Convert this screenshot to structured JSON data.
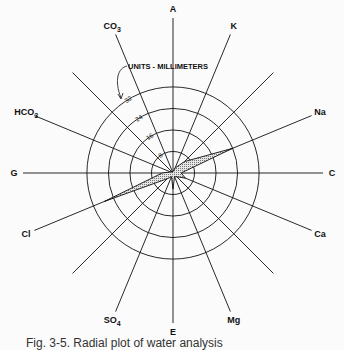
{
  "diagram": {
    "type": "radial-ion-diagram",
    "units_label": "UNITS - MILLIMETERS",
    "center": [
      173,
      173
    ],
    "px_per_mm": 2.69,
    "rings": [
      {
        "value": 8,
        "label": "8"
      },
      {
        "value": 16,
        "label": "16"
      },
      {
        "value": 24,
        "label": "24"
      },
      {
        "value": 32,
        "label": "32"
      }
    ],
    "spokes": [
      {
        "angle": 0,
        "label": "A"
      },
      {
        "angle": 22.5,
        "label": "K"
      },
      {
        "angle": 45,
        "label": ""
      },
      {
        "angle": 67.5,
        "label": "Na"
      },
      {
        "angle": 90,
        "label": "C"
      },
      {
        "angle": 112.5,
        "label": "Ca"
      },
      {
        "angle": 135,
        "label": ""
      },
      {
        "angle": 157.5,
        "label": "Mg"
      },
      {
        "angle": 180,
        "label": "E"
      },
      {
        "angle": 202.5,
        "label": "SO4"
      },
      {
        "angle": 225,
        "label": ""
      },
      {
        "angle": 247.5,
        "label": "Cl"
      },
      {
        "angle": 270,
        "label": "G"
      },
      {
        "angle": 292.5,
        "label": "HCO3"
      },
      {
        "angle": 315,
        "label": ""
      },
      {
        "angle": 337.5,
        "label": "CO3"
      }
    ],
    "polygon_values_mm": {
      "A": 0.5,
      "K": 2,
      "45": 6,
      "Na": 24,
      "C": 3,
      "Ca": 5,
      "135": 2,
      "Mg": 1.5,
      "E": 6,
      "SO4": 1.5,
      "225": 3,
      "Cl": 27.5,
      "G": 4,
      "HCO3": 1,
      "315": 0.5,
      "CO3": 0.5
    },
    "fill_color": "#c9c9c9",
    "line_color": "#111111"
  },
  "caption": "Fig. 3-5. Radial plot of water analysis"
}
